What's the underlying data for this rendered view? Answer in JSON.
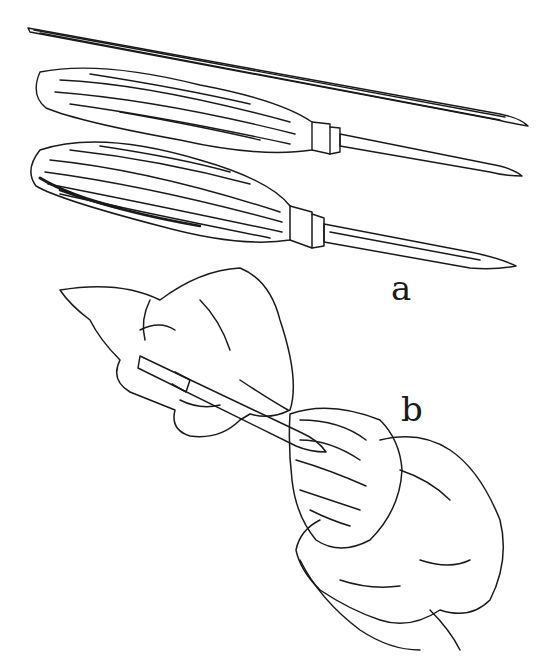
{
  "figure": {
    "labels": {
      "a": "a",
      "b": "b"
    },
    "parts": [
      {
        "id": "a",
        "content": "three hook knives: a bare blade and two wooden-handled knives with ferrules"
      },
      {
        "id": "b",
        "content": "hands holding a hook knife carving the inside of a turned wooden bowl"
      }
    ],
    "colors": {
      "ink": "#1a1a1a",
      "paper": "#ffffff"
    }
  }
}
